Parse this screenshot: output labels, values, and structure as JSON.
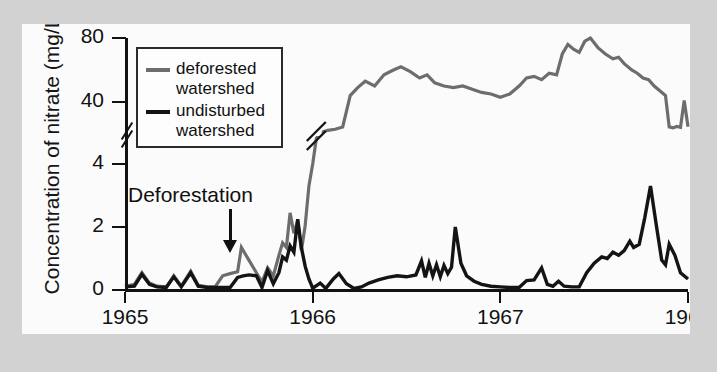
{
  "figure": {
    "background_color": "#d2d2d2",
    "panel_color": "#fbfbfb",
    "bleed_text": "      tals using elements in their course across Earth's surface\nmerous are the roles of the ecosystem and habitat features\nnich the elements that are used and regen-\nmpanies the organisms\n  ortunately for organisms, the\nstem for energy. Light arrives every day from the sun\nand once phototrophic organisms have\nnessize organic compounds, and their relative\nphosphorus, nitrogen, sulfur of the\n   a long way in ways that are not to\nto that the biological uptake and stored in the forest"
  },
  "chart_data": {
    "type": "line",
    "title": "",
    "xlabel": "Year",
    "ylabel": "Concentration of nitrate (mg/L)",
    "xlim": [
      1965,
      1968
    ],
    "x_ticks": [
      1965,
      1966,
      1967,
      1968
    ],
    "x_tick_labels": [
      "1965",
      "1966",
      "1967",
      "1968"
    ],
    "y_ticks": [
      0,
      2,
      4,
      40,
      80
    ],
    "y_tick_labels": [
      "0",
      "2",
      "4",
      "40",
      "80"
    ],
    "y_axis_break": {
      "between": [
        4,
        40
      ],
      "marker": "double-slash",
      "note": "y scale is broken between 4 and 40 mg/L"
    },
    "grid": false,
    "legend_position": "upper-left-inside",
    "annotations": [
      {
        "text": "Deforestation",
        "x": 1965.55,
        "arrow": "down",
        "points_to_y": 0.9
      }
    ],
    "series": [
      {
        "name": "deforested watershed",
        "color": "#6d6d6d",
        "points": [
          [
            1965.0,
            0.12
          ],
          [
            1965.05,
            0.18
          ],
          [
            1965.09,
            0.55
          ],
          [
            1965.13,
            0.22
          ],
          [
            1965.17,
            0.12
          ],
          [
            1965.22,
            0.1
          ],
          [
            1965.26,
            0.45
          ],
          [
            1965.3,
            0.12
          ],
          [
            1965.35,
            0.6
          ],
          [
            1965.39,
            0.15
          ],
          [
            1965.44,
            0.1
          ],
          [
            1965.48,
            0.1
          ],
          [
            1965.52,
            0.45
          ],
          [
            1965.56,
            0.52
          ],
          [
            1965.6,
            0.58
          ],
          [
            1965.62,
            1.35
          ],
          [
            1965.66,
            0.95
          ],
          [
            1965.7,
            0.55
          ],
          [
            1965.73,
            0.25
          ],
          [
            1965.76,
            0.7
          ],
          [
            1965.79,
            0.45
          ],
          [
            1965.82,
            1.1
          ],
          [
            1965.84,
            1.5
          ],
          [
            1965.86,
            1.35
          ],
          [
            1965.88,
            2.45
          ],
          [
            1965.9,
            1.8
          ],
          [
            1965.92,
            2.2
          ],
          [
            1965.94,
            1.25
          ],
          [
            1965.96,
            2.05
          ],
          [
            1965.98,
            3.3
          ],
          [
            1966.0,
            4.0
          ],
          [
            1966.02,
            14.0
          ],
          [
            1966.05,
            27.0
          ],
          [
            1966.08,
            31.0
          ],
          [
            1966.12,
            33.0
          ],
          [
            1966.16,
            38.0
          ],
          [
            1966.2,
            44.0
          ],
          [
            1966.24,
            49.0
          ],
          [
            1966.28,
            53.0
          ],
          [
            1966.33,
            50.0
          ],
          [
            1966.38,
            57.0
          ],
          [
            1966.43,
            60.0
          ],
          [
            1966.47,
            62.0
          ],
          [
            1966.52,
            59.0
          ],
          [
            1966.57,
            55.0
          ],
          [
            1966.61,
            57.0
          ],
          [
            1966.65,
            52.0
          ],
          [
            1966.7,
            50.0
          ],
          [
            1966.75,
            49.0
          ],
          [
            1966.8,
            50.0
          ],
          [
            1966.85,
            48.0
          ],
          [
            1966.9,
            46.0
          ],
          [
            1966.95,
            45.0
          ],
          [
            1967.0,
            43.0
          ],
          [
            1967.05,
            45.0
          ],
          [
            1967.1,
            50.0
          ],
          [
            1967.14,
            55.0
          ],
          [
            1967.18,
            56.0
          ],
          [
            1967.22,
            54.0
          ],
          [
            1967.26,
            58.0
          ],
          [
            1967.3,
            57.0
          ],
          [
            1967.33,
            70.0
          ],
          [
            1967.36,
            76.0
          ],
          [
            1967.39,
            73.0
          ],
          [
            1967.42,
            71.0
          ],
          [
            1967.45,
            78.0
          ],
          [
            1967.48,
            80.0
          ],
          [
            1967.52,
            74.0
          ],
          [
            1967.56,
            70.0
          ],
          [
            1967.6,
            67.0
          ],
          [
            1967.63,
            68.0
          ],
          [
            1967.66,
            64.0
          ],
          [
            1967.7,
            60.0
          ],
          [
            1967.73,
            58.0
          ],
          [
            1967.76,
            55.0
          ],
          [
            1967.79,
            54.0
          ],
          [
            1967.82,
            50.0
          ],
          [
            1967.85,
            47.0
          ],
          [
            1967.88,
            44.0
          ],
          [
            1967.9,
            38.0
          ],
          [
            1967.92,
            36.0
          ],
          [
            1967.94,
            39.0
          ],
          [
            1967.96,
            37.0
          ],
          [
            1967.98,
            41.0
          ],
          [
            1968.0,
            38.5
          ]
        ]
      },
      {
        "name": "undisturbed watershed",
        "color": "#141414",
        "points": [
          [
            1965.0,
            0.1
          ],
          [
            1965.05,
            0.12
          ],
          [
            1965.09,
            0.5
          ],
          [
            1965.13,
            0.18
          ],
          [
            1965.17,
            0.1
          ],
          [
            1965.22,
            0.08
          ],
          [
            1965.26,
            0.42
          ],
          [
            1965.3,
            0.1
          ],
          [
            1965.35,
            0.55
          ],
          [
            1965.39,
            0.12
          ],
          [
            1965.44,
            0.08
          ],
          [
            1965.48,
            0.08
          ],
          [
            1965.52,
            0.08
          ],
          [
            1965.56,
            0.08
          ],
          [
            1965.6,
            0.4
          ],
          [
            1965.63,
            0.45
          ],
          [
            1965.66,
            0.48
          ],
          [
            1965.7,
            0.45
          ],
          [
            1965.73,
            0.08
          ],
          [
            1965.76,
            0.62
          ],
          [
            1965.79,
            0.2
          ],
          [
            1965.82,
            0.55
          ],
          [
            1965.84,
            1.05
          ],
          [
            1965.86,
            0.95
          ],
          [
            1965.88,
            1.4
          ],
          [
            1965.9,
            1.2
          ],
          [
            1965.92,
            2.25
          ],
          [
            1965.94,
            1.35
          ],
          [
            1965.96,
            0.75
          ],
          [
            1965.98,
            0.35
          ],
          [
            1966.0,
            0.06
          ],
          [
            1966.04,
            0.22
          ],
          [
            1966.07,
            0.05
          ],
          [
            1966.11,
            0.35
          ],
          [
            1966.14,
            0.52
          ],
          [
            1966.18,
            0.2
          ],
          [
            1966.22,
            0.05
          ],
          [
            1966.26,
            0.1
          ],
          [
            1966.3,
            0.22
          ],
          [
            1966.35,
            0.32
          ],
          [
            1966.4,
            0.4
          ],
          [
            1966.45,
            0.45
          ],
          [
            1966.5,
            0.42
          ],
          [
            1966.55,
            0.48
          ],
          [
            1966.58,
            0.92
          ],
          [
            1966.6,
            0.4
          ],
          [
            1966.62,
            0.85
          ],
          [
            1966.64,
            0.45
          ],
          [
            1966.66,
            0.8
          ],
          [
            1966.68,
            0.42
          ],
          [
            1966.7,
            0.78
          ],
          [
            1966.72,
            0.52
          ],
          [
            1966.74,
            0.72
          ],
          [
            1966.76,
            2.0
          ],
          [
            1966.79,
            0.85
          ],
          [
            1966.82,
            0.45
          ],
          [
            1966.86,
            0.28
          ],
          [
            1966.9,
            0.18
          ],
          [
            1966.95,
            0.12
          ],
          [
            1967.0,
            0.1
          ],
          [
            1967.05,
            0.08
          ],
          [
            1967.1,
            0.08
          ],
          [
            1967.14,
            0.3
          ],
          [
            1967.18,
            0.32
          ],
          [
            1967.22,
            0.7
          ],
          [
            1967.25,
            0.18
          ],
          [
            1967.28,
            0.12
          ],
          [
            1967.31,
            0.28
          ],
          [
            1967.34,
            0.12
          ],
          [
            1967.38,
            0.1
          ],
          [
            1967.42,
            0.1
          ],
          [
            1967.46,
            0.55
          ],
          [
            1967.5,
            0.85
          ],
          [
            1967.54,
            1.05
          ],
          [
            1967.57,
            1.0
          ],
          [
            1967.6,
            1.2
          ],
          [
            1967.63,
            1.1
          ],
          [
            1967.66,
            1.25
          ],
          [
            1967.69,
            1.55
          ],
          [
            1967.71,
            1.35
          ],
          [
            1967.74,
            1.45
          ],
          [
            1967.77,
            2.3
          ],
          [
            1967.8,
            3.3
          ],
          [
            1967.83,
            2.1
          ],
          [
            1967.86,
            0.95
          ],
          [
            1967.88,
            0.8
          ],
          [
            1967.9,
            1.45
          ],
          [
            1967.93,
            1.1
          ],
          [
            1967.96,
            0.55
          ],
          [
            1968.0,
            0.35
          ]
        ]
      }
    ]
  },
  "legend": {
    "items": [
      {
        "label_line1": "deforested",
        "label_line2": "watershed",
        "color": "#6d6d6d"
      },
      {
        "label_line1": "undisturbed",
        "label_line2": "watershed",
        "color": "#141414"
      }
    ]
  }
}
